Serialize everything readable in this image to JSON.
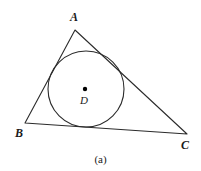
{
  "figure": {
    "caption": "(a)",
    "background_color": "#ffffff",
    "stroke_color": "#2b2b2b",
    "label_color": "#1a1a1a"
  },
  "labels": {
    "vertex_a": "A",
    "vertex_b": "B",
    "vertex_c": "C",
    "center_d": "D"
  },
  "chart_data": {
    "type": "diagram",
    "title": "(a)",
    "shapes": [
      {
        "name": "triangle-abc",
        "type": "polygon",
        "vertices": [
          {
            "label": "A",
            "x": 75,
            "y": 30
          },
          {
            "label": "B",
            "x": 25,
            "y": 123
          },
          {
            "label": "C",
            "x": 187,
            "y": 134
          }
        ],
        "fill": "none",
        "stroke": "#2b2b2b",
        "stroke_width": 1
      },
      {
        "name": "inscribed-circle",
        "type": "circle",
        "center": {
          "label": "D",
          "x": 86,
          "y": 89
        },
        "radius": 38,
        "fill": "none",
        "stroke": "#2b2b2b",
        "stroke_width": 1
      },
      {
        "name": "center-point",
        "type": "point",
        "center": {
          "label": "D",
          "x": 85,
          "y": 89
        },
        "radius": 2.2,
        "fill": "#000000"
      }
    ],
    "axis": {
      "grid": false,
      "legend": false
    }
  }
}
